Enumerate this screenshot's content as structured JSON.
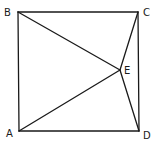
{
  "diagram": {
    "type": "geometry-figure",
    "points": [
      {
        "id": "A",
        "label": "A"
      },
      {
        "id": "B",
        "label": "B"
      },
      {
        "id": "C",
        "label": "C"
      },
      {
        "id": "D",
        "label": "D"
      },
      {
        "id": "E",
        "label": "E"
      }
    ],
    "segments": [
      [
        "A",
        "B"
      ],
      [
        "B",
        "C"
      ],
      [
        "C",
        "D"
      ],
      [
        "D",
        "A"
      ],
      [
        "B",
        "E"
      ],
      [
        "A",
        "E"
      ],
      [
        "C",
        "E"
      ],
      [
        "D",
        "E"
      ]
    ]
  }
}
